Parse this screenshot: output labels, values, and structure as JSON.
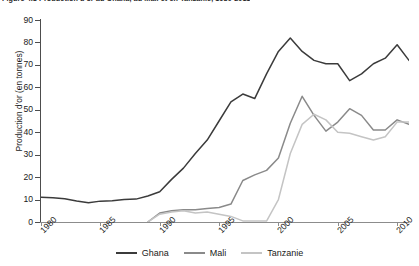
{
  "figure": {
    "title_prefix": "Figure 4.1",
    "title": "Figure 4.1  Production d'or au Ghana, au Mali et en Tanzanie, 1980-2011"
  },
  "axis": {
    "y_title": "Production d'or (en tonnes)",
    "y_ticks": [
      "0",
      "10",
      "20",
      "30",
      "40",
      "50",
      "60",
      "70",
      "80",
      "90"
    ],
    "x_ticks": [
      "1980",
      "1985",
      "1990",
      "1995",
      "2000",
      "2005",
      "2010"
    ]
  },
  "legend": {
    "position": "bottom-center",
    "items": [
      {
        "label": "Ghana",
        "color": "#3b3b3b"
      },
      {
        "label": "Mali",
        "color": "#8a8a8a"
      },
      {
        "label": "Tanzanie",
        "color": "#c4c4c4"
      }
    ]
  },
  "chart_data": {
    "type": "line",
    "title": "Figure 4.1  Production d'or au Ghana, au Mali et en Tanzanie, 1980-2011",
    "xlabel": "",
    "ylabel": "Production d'or (en tonnes)",
    "xlim": [
      1980,
      2011
    ],
    "ylim": [
      0,
      90
    ],
    "grid": false,
    "legend_position": "bottom-center",
    "x": [
      1980,
      1981,
      1982,
      1983,
      1984,
      1985,
      1986,
      1987,
      1988,
      1989,
      1990,
      1991,
      1992,
      1993,
      1994,
      1995,
      1996,
      1997,
      1998,
      1999,
      2000,
      2001,
      2002,
      2003,
      2004,
      2005,
      2006,
      2007,
      2008,
      2009,
      2010,
      2011
    ],
    "series": [
      {
        "name": "Ghana",
        "color": "#3b3b3b",
        "values": [
          11.0,
          10.8,
          10.4,
          9.4,
          8.6,
          9.3,
          9.5,
          10.0,
          10.2,
          11.6,
          13.5,
          19.0,
          24.0,
          30.5,
          36.5,
          45.0,
          53.5,
          57.0,
          55.0,
          66.0,
          76.0,
          82.0,
          76.0,
          72.0,
          70.5,
          70.5,
          63.0,
          66.0,
          70.5,
          73.0,
          79.0,
          72.0
        ]
      },
      {
        "name": "Mali",
        "color": "#8a8a8a",
        "values": [
          0.0,
          0.0,
          0.0,
          0.0,
          0.0,
          0.0,
          0.0,
          0.0,
          0.0,
          0.0,
          4.0,
          5.0,
          5.5,
          5.5,
          6.0,
          6.5,
          8.0,
          18.5,
          21.0,
          23.0,
          28.5,
          44.0,
          56.0,
          47.5,
          40.5,
          44.5,
          50.5,
          47.5,
          41.0,
          41.0,
          45.5,
          43.5
        ]
      },
      {
        "name": "Tanzanie",
        "color": "#c4c4c4",
        "values": [
          0.0,
          0.0,
          0.0,
          0.0,
          0.0,
          0.0,
          0.0,
          0.0,
          0.0,
          0.0,
          3.5,
          4.5,
          5.0,
          4.0,
          4.5,
          3.5,
          2.5,
          0.5,
          0.4,
          0.4,
          10.0,
          30.5,
          43.5,
          48.0,
          45.5,
          40.0,
          39.5,
          38.0,
          36.5,
          38.0,
          44.5,
          44.5
        ]
      }
    ]
  }
}
